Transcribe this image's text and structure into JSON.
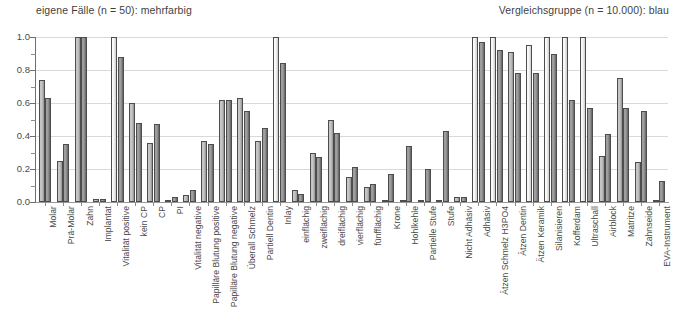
{
  "header": {
    "left_caption": "eigene Fälle (n = 50): mehrfarbig",
    "right_caption": "Vergleichsgruppe (n = 10.000): blau"
  },
  "axis": {
    "y_ticks": [
      "1.0",
      "0.8",
      "0.6",
      "0.4",
      "0.2",
      "0.0"
    ],
    "y_min": 0.0,
    "y_max": 1.0
  },
  "colors": {
    "own_series": "#ededed",
    "reference_series": "#8c8c8c",
    "gridline": "#d9d9d9",
    "axis": "#6e6e6e",
    "text": "#4a4a4a"
  },
  "chart_data": {
    "type": "bar",
    "title": "",
    "subtitle": "",
    "xlabel": "",
    "ylabel": "",
    "ylim": [
      0.0,
      1.0
    ],
    "grid": true,
    "legend_position": "top",
    "categories": [
      "Molar",
      "Prä-Molar",
      "Zahn",
      "Implantat",
      "Vitalität positive",
      "kein CP",
      "CP",
      "PI",
      "Vitalität negative",
      "Papilläre Blutung positive",
      "Papilläre Blutung negative",
      "Überall Schmelz",
      "Partiell Dentin",
      "Inlay",
      "einflächig",
      "zweiflächig",
      "dreiflächig",
      "vierflächig",
      "fünfflächig",
      "Krone",
      "Hohlkehle",
      "Partielle Stufe",
      "Stufe",
      "Nicht Adhäsiv",
      "Adhäsiv",
      "Ätzen Schmelz H3PO4",
      "Ätzen Dentin",
      "Ätzen Keramik",
      "Silanisieren",
      "Kofferdam",
      "Ultraschall",
      "Airblock",
      "Matritze",
      "Zahnseide",
      "EVA-Instrument"
    ],
    "series": [
      {
        "name": "eigene Fälle (n = 50): mehrfarbig",
        "values": [
          0.74,
          0.25,
          1.0,
          0.02,
          1.0,
          0.6,
          0.36,
          0.01,
          0.04,
          0.37,
          0.62,
          0.63,
          0.37,
          1.0,
          0.07,
          0.3,
          0.5,
          0.15,
          0.09,
          0.01,
          0.01,
          0.01,
          0.01,
          0.03,
          1.0,
          1.0,
          0.91,
          0.95,
          1.0,
          1.0,
          1.0,
          0.28,
          0.75,
          0.24,
          0.01
        ]
      },
      {
        "name": "Vergleichsgruppe (n = 10.000): blau",
        "values": [
          0.63,
          0.35,
          1.0,
          0.02,
          0.88,
          0.48,
          0.47,
          0.03,
          0.07,
          0.35,
          0.62,
          0.55,
          0.45,
          0.84,
          0.05,
          0.27,
          0.42,
          0.21,
          0.11,
          0.17,
          0.34,
          0.2,
          0.43,
          0.03,
          0.97,
          0.92,
          0.78,
          0.78,
          0.9,
          0.62,
          0.57,
          0.41,
          0.57,
          0.55,
          0.13
        ]
      }
    ]
  }
}
